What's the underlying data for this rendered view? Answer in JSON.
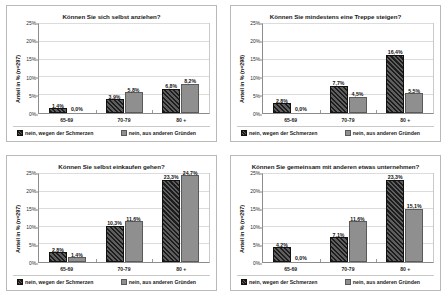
{
  "legend": {
    "series": [
      {
        "label": "nein, wegen der Schmerzen",
        "color": "#2a2a2a",
        "pattern": "diagonal-hatch"
      },
      {
        "label": "nein, aus anderen Gründen",
        "color": "#8f8f8f",
        "pattern": "solid"
      }
    ]
  },
  "axis": {
    "ticks": [
      "25%",
      "20%",
      "15%",
      "10%",
      "5%",
      "0%"
    ],
    "categories": [
      "65-69",
      "70-79",
      "80 +"
    ]
  },
  "chart_data": [
    {
      "type": "bar",
      "title": "Können Sie sich selbst anziehen?",
      "ylabel": "Anteil in % (n=297)",
      "xlabel": "",
      "categories": [
        "65-69",
        "70-79",
        "80 +"
      ],
      "series": [
        {
          "name": "nein, wegen der Schmerzen",
          "values": [
            1.4,
            3.9,
            6.8
          ],
          "labels": [
            "1,4%",
            "3,9%",
            "6,8%"
          ]
        },
        {
          "name": "nein, aus anderen Gründen",
          "values": [
            0.0,
            5.8,
            8.2
          ],
          "labels": [
            "0,0%",
            "5,8%",
            "8,2%"
          ]
        }
      ],
      "ylim": [
        0,
        25
      ],
      "yticks": [
        0,
        5,
        10,
        15,
        20,
        25
      ],
      "grid": true,
      "legend_position": "bottom"
    },
    {
      "type": "bar",
      "title": "Können Sie mindestens eine Treppe steigen?",
      "ylabel": "Anteil in % (n=298)",
      "xlabel": "",
      "categories": [
        "65-69",
        "70-79",
        "80 +"
      ],
      "series": [
        {
          "name": "nein, wegen der Schmerzen",
          "values": [
            2.8,
            7.7,
            16.4
          ],
          "labels": [
            "2,8%",
            "7,7%",
            "16,4%"
          ]
        },
        {
          "name": "nein, aus anderen Gründen",
          "values": [
            0.0,
            4.5,
            5.5
          ],
          "labels": [
            "0,0%",
            "4,5%",
            "5,5%"
          ]
        }
      ],
      "ylim": [
        0,
        25
      ],
      "yticks": [
        0,
        5,
        10,
        15,
        20,
        25
      ],
      "grid": true,
      "legend_position": "bottom"
    },
    {
      "type": "bar",
      "title": "Können Sie selbst einkaufen gehen?",
      "ylabel": "Anteil in % (n=297)",
      "xlabel": "",
      "categories": [
        "65-69",
        "70-79",
        "80 +"
      ],
      "series": [
        {
          "name": "nein, wegen der Schmerzen",
          "values": [
            2.8,
            10.3,
            23.3
          ],
          "labels": [
            "2,8%",
            "10,3%",
            "23,3%"
          ]
        },
        {
          "name": "nein, aus anderen Gründen",
          "values": [
            1.4,
            11.6,
            24.7
          ],
          "labels": [
            "1,4%",
            "11,6%",
            "24,7%"
          ]
        }
      ],
      "ylim": [
        0,
        25
      ],
      "yticks": [
        0,
        5,
        10,
        15,
        20,
        25
      ],
      "grid": true,
      "legend_position": "bottom"
    },
    {
      "type": "bar",
      "title": "Können Sie gemeinsam mit anderen etwas unternehmen?",
      "ylabel": "Anteil in % (n=297)",
      "xlabel": "",
      "categories": [
        "65-69",
        "70-79",
        "80 +"
      ],
      "series": [
        {
          "name": "nein, wegen der Schmerzen",
          "values": [
            4.2,
            7.1,
            23.3
          ],
          "labels": [
            "4,2%",
            "7,1%",
            "23,3%"
          ]
        },
        {
          "name": "nein, aus anderen Gründen",
          "values": [
            0.0,
            11.6,
            15.1
          ],
          "labels": [
            "0,0%",
            "11,6%",
            "15,1%"
          ]
        }
      ],
      "ylim": [
        0,
        25
      ],
      "yticks": [
        0,
        5,
        10,
        15,
        20,
        25
      ],
      "grid": true,
      "legend_position": "bottom"
    }
  ]
}
